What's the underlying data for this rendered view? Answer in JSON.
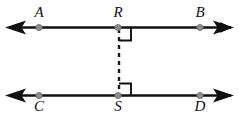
{
  "figure": {
    "kind": "geometry-diagram",
    "width": 239,
    "height": 120,
    "background_color": "#ffffff",
    "stroke_color": "#111111",
    "point_fill_color": "#8c8c8c",
    "point_stroke_color": "#5e5e5e",
    "dash_color": "#1a1a1a",
    "line_width": 2.6,
    "dash_pattern": "4,4"
  },
  "lines": [
    {
      "id": "line-AB",
      "name": "upper-line",
      "y": 27.5,
      "x_start": 9,
      "x_end": 231,
      "arrow_start": true,
      "arrow_end": true,
      "points": [
        {
          "id": "A",
          "label": "A",
          "x": 39,
          "label_x": 39,
          "label_y": 17,
          "label_position": "above"
        },
        {
          "id": "R",
          "label": "R",
          "x": 118,
          "label_x": 118,
          "label_y": 17,
          "label_position": "above"
        },
        {
          "id": "B",
          "label": "B",
          "x": 200,
          "label_x": 200,
          "label_y": 17,
          "label_position": "above"
        }
      ]
    },
    {
      "id": "line-CD",
      "name": "lower-line",
      "y": 95.5,
      "x_start": 9,
      "x_end": 231,
      "arrow_start": true,
      "arrow_end": true,
      "points": [
        {
          "id": "C",
          "label": "C",
          "x": 39,
          "label_x": 39,
          "label_y": 111,
          "label_position": "below"
        },
        {
          "id": "S",
          "label": "S",
          "x": 118,
          "label_x": 118,
          "label_y": 111,
          "label_position": "below"
        },
        {
          "id": "D",
          "label": "D",
          "x": 200,
          "label_x": 200,
          "label_y": 111,
          "label_position": "below"
        }
      ]
    }
  ],
  "transversal": {
    "id": "segment-RS",
    "name": "dashed-transversal-RS",
    "x": 119,
    "y_start": 29,
    "y_end": 94,
    "style": "dashed"
  },
  "right_angle_marks": [
    {
      "id": "right-angle-R",
      "name": "right-angle-mark-at-R",
      "vertex": "R",
      "x": 119,
      "y": 28,
      "size": 12,
      "orientation": "below-right",
      "measure_degrees": 90
    },
    {
      "id": "right-angle-S",
      "name": "right-angle-mark-at-S",
      "vertex": "S",
      "x": 119,
      "y": 95,
      "size": 12,
      "orientation": "above-right",
      "measure_degrees": 90
    }
  ],
  "labels": {
    "A": "A",
    "B": "B",
    "C": "C",
    "D": "D",
    "R": "R",
    "S": "S"
  }
}
